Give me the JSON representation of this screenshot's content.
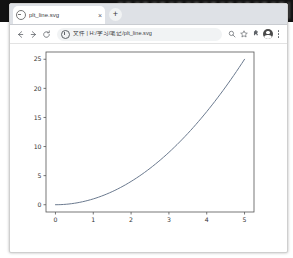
{
  "window": {
    "frame_border_color": "#cfcfcf",
    "tabstrip_bg": "#dee1e6"
  },
  "tabstrip": {
    "favicon_name": "document-favicon",
    "tab_title": "plt_line.svg",
    "close_label": "×",
    "new_tab_label": "+"
  },
  "toolbar": {
    "back_label": "back-arrow",
    "forward_label": "forward-arrow",
    "reload_label": "reload-arrow",
    "omnibox_value": "文件 | H:/学习/笔记/plt_line.svg",
    "omnibox_placeholder": "搜索或输入网址",
    "search_icon": "search-icon",
    "bookmark_icon": "star-icon",
    "extensions_icon": "extensions-icon",
    "profile_icon": "profile-avatar-icon",
    "menu_icon": "three-dots-menu-icon"
  },
  "chart_data": {
    "type": "line",
    "title": "",
    "xlabel": "",
    "ylabel": "",
    "x": [
      0,
      1,
      2,
      3,
      4,
      5
    ],
    "values": [
      0,
      1,
      4,
      9,
      16,
      25
    ],
    "series": [
      {
        "name": "y = x^2",
        "values": [
          0,
          1,
          4,
          9,
          16,
          25
        ]
      }
    ],
    "xlim": [
      -0.25,
      5.25
    ],
    "ylim": [
      -1.25,
      26.25
    ],
    "xticks": [
      0,
      1,
      2,
      3,
      4,
      5
    ],
    "yticks": [
      0,
      5,
      10,
      15,
      20,
      25
    ],
    "xtick_labels": [
      "0",
      "1",
      "2",
      "3",
      "4",
      "5"
    ],
    "ytick_labels": [
      "0",
      "5",
      "10",
      "15",
      "20",
      "25"
    ],
    "grid": false,
    "legend": "none",
    "line_color": "#6b7a8f",
    "axis_color": "#555555",
    "background": "#ffffff"
  }
}
